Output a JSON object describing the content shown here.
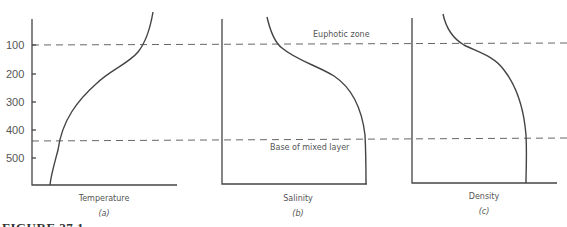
{
  "figure": {
    "caption": "FIGURE 27.1",
    "y_ticks": [
      "100",
      "200",
      "300",
      "400",
      "500"
    ],
    "annotations": {
      "upper_line": "Euphotic zone",
      "lower_line": "Base of mixed layer"
    },
    "panels": [
      {
        "tag": "(a)",
        "title": "Temperature"
      },
      {
        "tag": "(b)",
        "title": "Salinity"
      },
      {
        "tag": "(c)",
        "title": "Density"
      }
    ]
  },
  "colors": {
    "line": "#444444",
    "text": "#555555",
    "background": "#ffffff"
  }
}
